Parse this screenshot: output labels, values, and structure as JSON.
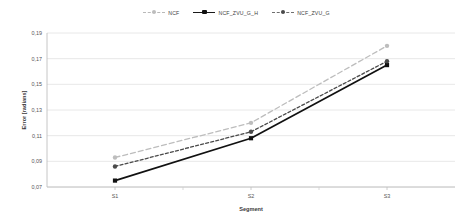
{
  "chart_data": {
    "type": "line",
    "title": "",
    "xlabel": "Segment",
    "ylabel": "Error [radians]",
    "categories": [
      "S1",
      "S2",
      "S3"
    ],
    "ylim": [
      0.07,
      0.19
    ],
    "ytick_step": 0.02,
    "ytick_labels": [
      "0,07",
      "0,09",
      "0,11",
      "0,13",
      "0,15",
      "0,17",
      "0,19"
    ],
    "ytick_values": [
      0.07,
      0.09,
      0.11,
      0.13,
      0.15,
      0.17,
      0.19
    ],
    "grid": true,
    "legend_position": "top-center",
    "decimal_separator": ",",
    "series": [
      {
        "name": "NCF",
        "values": [
          0.093,
          0.12,
          0.18
        ],
        "color": "#bdbdbd",
        "line_style": "dashed",
        "marker": "circle"
      },
      {
        "name": "NCF_ZVU_G_H",
        "values": [
          0.075,
          0.108,
          0.165
        ],
        "color": "#111111",
        "line_style": "solid",
        "marker": "square"
      },
      {
        "name": "NCF_ZVU_G",
        "values": [
          0.086,
          0.113,
          0.168
        ],
        "color": "#4a4a4a",
        "line_style": "dashed",
        "marker": "circle"
      }
    ]
  },
  "legend": {
    "items": [
      {
        "label": "NCF"
      },
      {
        "label": "NCF_ZVU_G_H"
      },
      {
        "label": "NCF_ZVU_G"
      }
    ]
  },
  "axes": {
    "y_title": "Error [radians]",
    "x_title": "Segment"
  }
}
